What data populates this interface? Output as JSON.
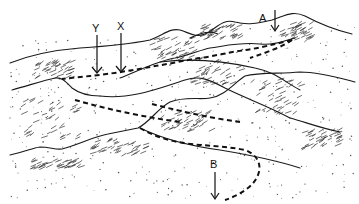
{
  "diagram": {
    "labels": [
      {
        "id": "Y",
        "text": "Y"
      },
      {
        "id": "X",
        "text": "X"
      },
      {
        "id": "A",
        "text": "A"
      },
      {
        "id": "B",
        "text": "B"
      }
    ],
    "colors": {
      "ink": "#111111",
      "background": "#ffffff"
    }
  }
}
